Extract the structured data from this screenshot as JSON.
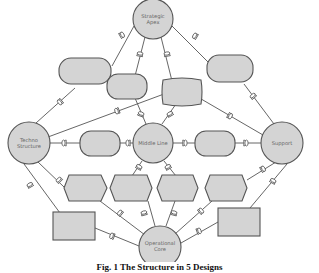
{
  "diagram": {
    "colors": {
      "fill": "#d4d4d4",
      "stroke": "#555555",
      "line": "#555555",
      "background": "#ffffff"
    },
    "nodes": {
      "strategic_apex": {
        "line1": "Strategic",
        "line2": "Apex"
      },
      "techno_structure": {
        "line1": "Techno",
        "line2": "Structure"
      },
      "middle_line": {
        "label": "Middle Line"
      },
      "support": {
        "label": "Support"
      },
      "operational_core": {
        "line1": "Operational",
        "line2": "Core"
      }
    },
    "unlabeled_shapes": {
      "rounded_rectangles": 6,
      "hexagons": 4,
      "rectangles": 2
    }
  },
  "caption": "Fig. 1  The Structure in 5 Designs"
}
